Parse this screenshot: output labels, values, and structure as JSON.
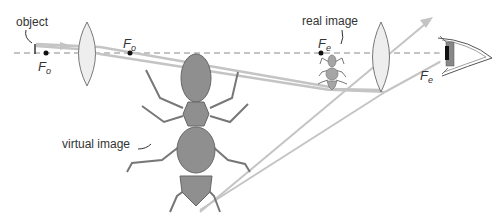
{
  "diagram": {
    "type": "compound microscope ray diagram",
    "labels": {
      "object": "object",
      "real_image": "real image",
      "virtual_image": "virtual image"
    },
    "focal_points": [
      {
        "id": "objective-left",
        "letter": "F",
        "subscript": "o"
      },
      {
        "id": "objective-right",
        "letter": "F",
        "subscript": "o"
      },
      {
        "id": "eyepiece-left",
        "letter": "F",
        "subscript": "e"
      },
      {
        "id": "eyepiece-right",
        "letter": "F",
        "subscript": "e"
      }
    ],
    "colors": {
      "ray": "#bdbdbd",
      "axis": "#888888",
      "lens_fill": "#eeeeee",
      "lens_stroke": "#777777",
      "ant_fill": "#8f8f8f",
      "ant_stroke": "#666666",
      "text": "#333333"
    }
  }
}
